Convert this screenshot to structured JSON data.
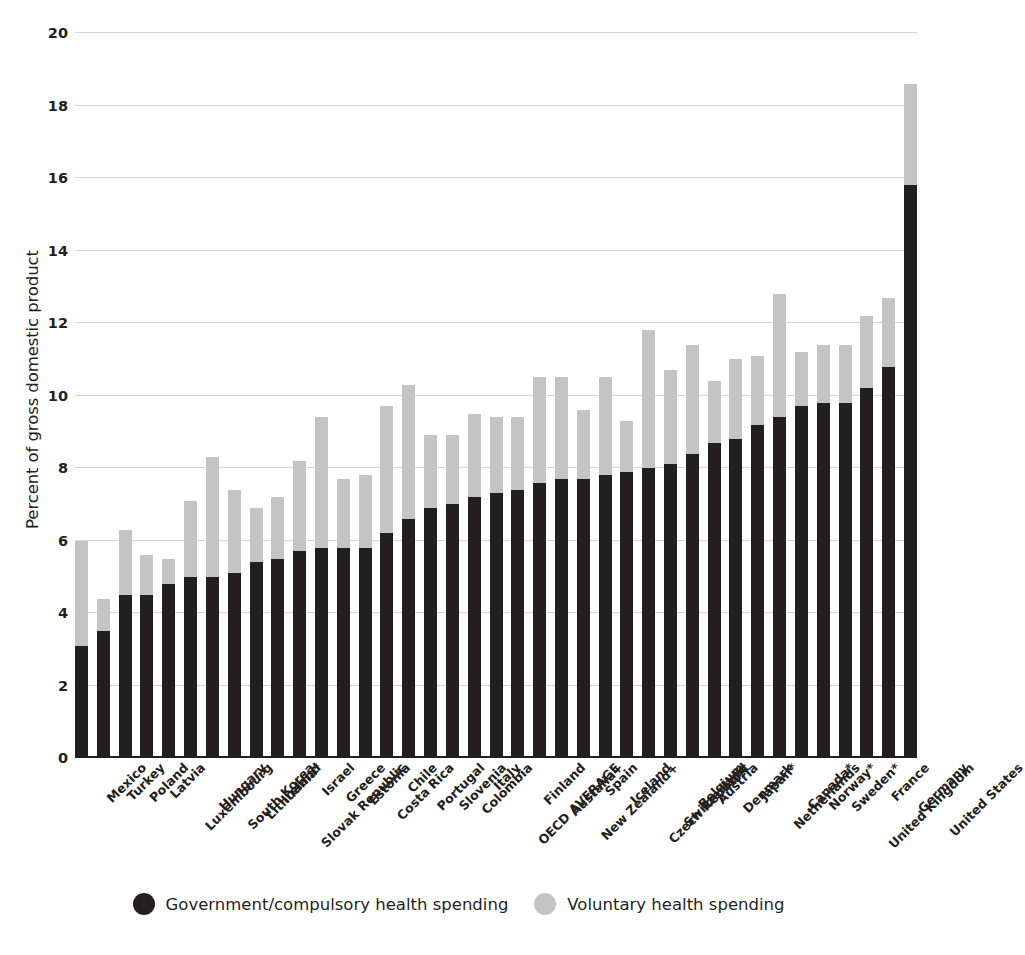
{
  "chart_data": {
    "type": "bar",
    "subtype": "stacked-bar",
    "title": "",
    "xlabel": "",
    "ylabel": "Percent of gross domestic product",
    "ylim": [
      0,
      20
    ],
    "yticks": [
      0,
      2,
      4,
      6,
      8,
      10,
      12,
      14,
      16,
      18,
      20
    ],
    "grid": true,
    "legend_position": "bottom",
    "colors": {
      "government": "#231f20",
      "voluntary": "#c4c4c4",
      "gridline": "#d4d4d4",
      "axis": "#231f20",
      "background": "#ffffff"
    },
    "categories": [
      "Mexico",
      "Turkey",
      "Poland",
      "Latvia",
      "Luxembourg",
      "Hungary",
      "South Korea",
      "Lithuania*",
      "Ireland",
      "Slovak Republic",
      "Israel",
      "Greece",
      "Estonia",
      "Costa Rica",
      "Chile",
      "Portugal",
      "Slovenia",
      "Colombia",
      "Italy",
      "OECD AVERAGE",
      "Finland",
      "Austalia+",
      "New Zealand+",
      "Spain",
      "Iceland",
      "Czech Republic",
      "Switzerland",
      "Belgium",
      "Austria",
      "Denmark",
      "Japan*",
      "Netherlands",
      "Canada*",
      "Norway*",
      "Sweden*",
      "United Kingdom",
      "France",
      "Germany",
      "United States"
    ],
    "series": [
      {
        "name": "Government/compulsory health spending",
        "color": "#231f20",
        "values": [
          3.1,
          3.5,
          4.5,
          4.5,
          4.8,
          5.0,
          5.0,
          5.1,
          5.4,
          5.5,
          5.7,
          5.8,
          5.8,
          5.8,
          6.2,
          6.6,
          6.9,
          7.0,
          7.2,
          7.3,
          7.4,
          7.6,
          7.7,
          7.7,
          7.8,
          7.9,
          8.0,
          8.1,
          8.4,
          8.7,
          8.8,
          9.2,
          9.4,
          9.7,
          9.8,
          9.8,
          10.2,
          10.8,
          15.8
        ]
      },
      {
        "name": "Voluntary health spending",
        "color": "#c4c4c4",
        "values": [
          2.9,
          0.9,
          1.8,
          1.1,
          0.7,
          2.1,
          3.3,
          2.3,
          1.5,
          1.7,
          2.5,
          3.6,
          1.9,
          2.0,
          3.5,
          3.7,
          2.0,
          1.9,
          2.3,
          2.1,
          2.0,
          2.9,
          2.8,
          1.9,
          2.7,
          1.4,
          3.8,
          2.6,
          3.0,
          1.7,
          2.2,
          1.9,
          3.4,
          1.5,
          1.6,
          1.6,
          2.0,
          1.9,
          2.8
        ]
      }
    ],
    "totals": [
      6.0,
      4.4,
      6.3,
      5.6,
      5.5,
      7.1,
      8.3,
      7.4,
      6.9,
      7.2,
      8.2,
      9.4,
      7.7,
      7.8,
      9.7,
      10.3,
      8.9,
      8.9,
      9.5,
      9.4,
      9.4,
      10.5,
      10.5,
      9.6,
      10.5,
      9.3,
      11.8,
      10.7,
      11.4,
      10.4,
      11.0,
      11.1,
      12.8,
      11.2,
      11.4,
      11.4,
      12.2,
      12.7,
      18.6
    ]
  },
  "axis": {
    "y_title": "Percent of gross domestic product",
    "y_ticks": [
      "20",
      "18",
      "16",
      "14",
      "12",
      "10",
      "8",
      "6",
      "4",
      "2",
      "0"
    ]
  },
  "legend": {
    "items": [
      {
        "label": "Government/compulsory health spending",
        "color": "#231f20",
        "icon": "filled-circle-dark"
      },
      {
        "label": "Voluntary health spending",
        "color": "#c4c4c4",
        "icon": "filled-circle-light"
      }
    ]
  }
}
